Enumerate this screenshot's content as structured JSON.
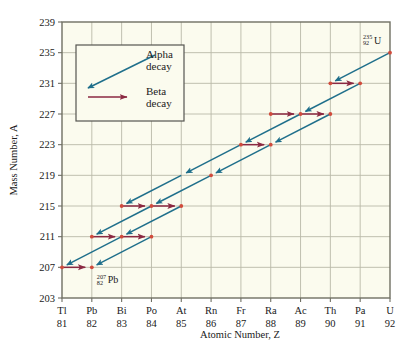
{
  "chart_data": {
    "type": "scatter",
    "title": "",
    "xlabel": "Atomic Number, Z",
    "ylabel": "Mass Number, A",
    "xlim": [
      81,
      92
    ],
    "ylim": [
      203,
      239
    ],
    "grid": true,
    "legend_position": "upper-left-inside",
    "x_tick_elements": [
      "Tl",
      "Pb",
      "Bi",
      "Po",
      "At",
      "Rn",
      "Fr",
      "Ra",
      "Ac",
      "Th",
      "Pa",
      "U"
    ],
    "x_tick_numbers": [
      "81",
      "82",
      "83",
      "84",
      "85",
      "86",
      "87",
      "88",
      "89",
      "90",
      "91",
      "92"
    ],
    "y_ticks": [
      "203",
      "207",
      "211",
      "215",
      "219",
      "223",
      "227",
      "231",
      "235",
      "239"
    ],
    "legend": [
      {
        "label_line1": "Alpha",
        "label_line2": "decay",
        "color": "#1f6f8b",
        "kind": "alpha"
      },
      {
        "label_line1": "Beta",
        "label_line2": "decay",
        "color": "#8b2942",
        "kind": "beta"
      }
    ],
    "annotations": [
      {
        "text": "U",
        "superscript": "235",
        "subscript": "92",
        "z": 92,
        "a": 235
      },
      {
        "text": "Pb",
        "superscript": "207",
        "subscript": "82",
        "z": 82,
        "a": 207
      }
    ],
    "points": [
      {
        "z": 92,
        "a": 235
      },
      {
        "z": 91,
        "a": 231
      },
      {
        "z": 90,
        "a": 231
      },
      {
        "z": 89,
        "a": 227
      },
      {
        "z": 88,
        "a": 227
      },
      {
        "z": 90,
        "a": 227
      },
      {
        "z": 87,
        "a": 223
      },
      {
        "z": 88,
        "a": 223
      },
      {
        "z": 86,
        "a": 219
      },
      {
        "z": 85,
        "a": 215
      },
      {
        "z": 84,
        "a": 215
      },
      {
        "z": 83,
        "a": 215
      },
      {
        "z": 84,
        "a": 211
      },
      {
        "z": 83,
        "a": 211
      },
      {
        "z": 82,
        "a": 211
      },
      {
        "z": 82,
        "a": 207
      },
      {
        "z": 81,
        "a": 207
      }
    ],
    "alpha_decays": [
      {
        "from_z": 92,
        "from_a": 235,
        "to_z": 90,
        "to_a": 231
      },
      {
        "from_z": 91,
        "from_a": 231,
        "to_z": 89,
        "to_a": 227
      },
      {
        "from_z": 90,
        "from_a": 227,
        "to_z": 88,
        "to_a": 223
      },
      {
        "from_z": 89,
        "from_a": 227,
        "to_z": 87,
        "to_a": 223
      },
      {
        "from_z": 88,
        "from_a": 223,
        "to_z": 86,
        "to_a": 219
      },
      {
        "from_z": 87,
        "from_a": 223,
        "to_z": 85,
        "to_a": 219
      },
      {
        "from_z": 86,
        "from_a": 219,
        "to_z": 84,
        "to_a": 215
      },
      {
        "from_z": 85,
        "from_a": 219,
        "to_z": 83,
        "to_a": 215
      },
      {
        "from_z": 85,
        "from_a": 215,
        "to_z": 83,
        "to_a": 211
      },
      {
        "from_z": 84,
        "from_a": 215,
        "to_z": 82,
        "to_a": 211
      },
      {
        "from_z": 84,
        "from_a": 211,
        "to_z": 82,
        "to_a": 207
      },
      {
        "from_z": 83,
        "from_a": 211,
        "to_z": 81,
        "to_a": 207
      }
    ],
    "beta_decays": [
      {
        "from_z": 90,
        "from_a": 231,
        "to_z": 91,
        "to_a": 231
      },
      {
        "from_z": 88,
        "from_a": 227,
        "to_z": 89,
        "to_a": 227
      },
      {
        "from_z": 89,
        "from_a": 227,
        "to_z": 90,
        "to_a": 227
      },
      {
        "from_z": 87,
        "from_a": 223,
        "to_z": 88,
        "to_a": 223
      },
      {
        "from_z": 83,
        "from_a": 215,
        "to_z": 84,
        "to_a": 215
      },
      {
        "from_z": 84,
        "from_a": 215,
        "to_z": 85,
        "to_a": 215
      },
      {
        "from_z": 82,
        "from_a": 211,
        "to_z": 83,
        "to_a": 211
      },
      {
        "from_z": 83,
        "from_a": 211,
        "to_z": 84,
        "to_a": 211
      },
      {
        "from_z": 81,
        "from_a": 207,
        "to_z": 82,
        "to_a": 207
      }
    ]
  },
  "colors": {
    "alpha": "#1f6f8b",
    "beta": "#8b2942",
    "point": "#d14b3c",
    "grid": "#b9b9a8",
    "frame": "#6f6f63",
    "plot_bg": "#fbfbee",
    "page_bg": "#ffffff"
  }
}
